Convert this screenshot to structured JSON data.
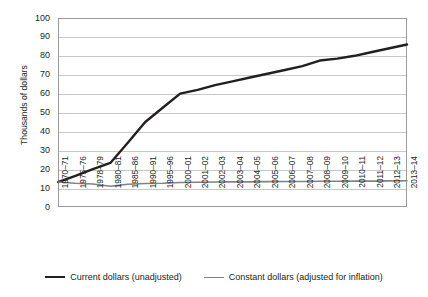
{
  "chart_data": {
    "type": "line",
    "title": "",
    "xlabel": "",
    "ylabel": "Thousands of dollars",
    "ylim": [
      0,
      100
    ],
    "yticks": [
      0,
      10,
      20,
      30,
      40,
      50,
      60,
      70,
      80,
      90,
      100
    ],
    "grid": true,
    "legend_position": "bottom",
    "categories": [
      "1970–71",
      "1975–76",
      "1978–79",
      "1980–81",
      "1985–86",
      "1990–91",
      "1995–96",
      "2000–01",
      "2001–02",
      "2002–03",
      "2003–04",
      "2004–05",
      "2005–06",
      "2006–07",
      "2007–08",
      "2008–09",
      "2009–10",
      "2010–11",
      "2011–12",
      "2012–13",
      "2013–14"
    ],
    "series": [
      {
        "name": "Current dollars (unadjusted)",
        "color": "#231f20",
        "width": 2.4,
        "values": [
          13.2,
          16.5,
          20.0,
          23.3,
          34.0,
          45.0,
          52.5,
          60.0,
          62.0,
          64.5,
          66.5,
          68.5,
          70.5,
          72.5,
          74.5,
          77.5,
          78.5,
          80.0,
          82.0,
          84.0,
          86.0
        ]
      },
      {
        "name": "Constant dollars (adjusted for inflation)",
        "color": "#808285",
        "width": 1.6,
        "values": [
          13.2,
          12.6,
          12.2,
          11.0,
          12.0,
          12.4,
          12.6,
          13.0,
          13.1,
          13.2,
          13.3,
          13.3,
          13.4,
          13.5,
          13.5,
          13.6,
          13.6,
          13.7,
          13.7,
          13.8,
          13.9
        ]
      }
    ]
  },
  "legend": {
    "items": [
      {
        "label": "Current dollars (unadjusted)",
        "color": "#231f20",
        "width": "2.4px"
      },
      {
        "label": "Constant dollars (adjusted for inflation)",
        "color": "#808285",
        "width": "1.6px"
      }
    ]
  }
}
